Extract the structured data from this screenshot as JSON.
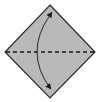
{
  "diagram": {
    "type": "origami-fold-step",
    "canvas": {
      "width": 100,
      "height": 102,
      "background": "#ffffff"
    },
    "paper": {
      "shape": "diamond",
      "vertices": {
        "top": [
          50,
          5
        ],
        "right": [
          95,
          52
        ],
        "bottom": [
          50,
          98
        ],
        "left": [
          5,
          52
        ]
      },
      "fill": "#b9b9b9",
      "stroke": "#2a2a2a",
      "stroke_width": 1.2
    },
    "fold_line": {
      "style": "dashed",
      "label": "valley fold",
      "from": [
        6,
        52
      ],
      "to": [
        94,
        52
      ],
      "stroke": "#1a1a1a",
      "dash": "4 3"
    },
    "arrow": {
      "style": "curved-double-headed",
      "meaning": "fold top corner down to bottom corner",
      "start": [
        50,
        15
      ],
      "control": [
        24,
        52
      ],
      "end": [
        50,
        88
      ],
      "stroke": "#1a1a1a"
    }
  }
}
